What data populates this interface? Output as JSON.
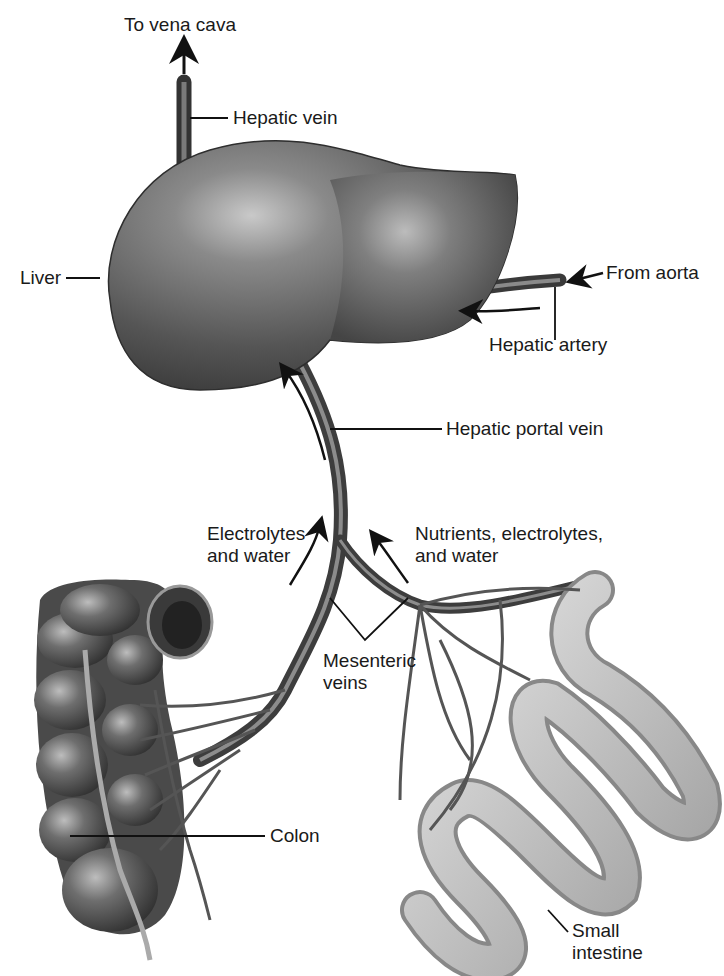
{
  "diagram": {
    "labels": {
      "to_vena_cava": "To vena cava",
      "hepatic_vein": "Hepatic vein",
      "liver": "Liver",
      "from_aorta": "From aorta",
      "hepatic_artery": "Hepatic artery",
      "hepatic_portal_vein": "Hepatic portal vein",
      "electrolytes_line1": "Electrolytes",
      "electrolytes_line2": "and water",
      "nutrients_line1": "Nutrients, electrolytes,",
      "nutrients_line2": "and water",
      "mesenteric_line1": "Mesenteric",
      "mesenteric_line2": "veins",
      "colon": "Colon",
      "small_intestine_line1": "Small",
      "small_intestine_line2": "intestine"
    },
    "flow_arrows": [
      {
        "from": "hepatic vein",
        "to": "vena cava"
      },
      {
        "from": "aorta",
        "to": "hepatic artery"
      },
      {
        "from": "hepatic artery",
        "to": "liver"
      },
      {
        "from": "colon",
        "to": "hepatic portal vein",
        "carries": "Electrolytes and water"
      },
      {
        "from": "small intestine",
        "to": "hepatic portal vein",
        "carries": "Nutrients, electrolytes, and water"
      },
      {
        "from": "hepatic portal vein",
        "to": "liver"
      }
    ],
    "colors": {
      "organ_dark": "#4a4a4a",
      "organ_mid": "#7a7a7a",
      "organ_light": "#c8c8c8",
      "text": "#1a1a1a",
      "background": "#ffffff"
    }
  }
}
